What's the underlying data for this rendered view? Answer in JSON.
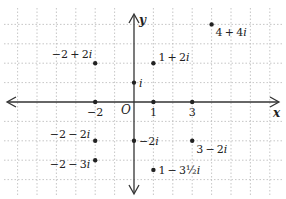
{
  "diagram": {
    "type": "complex-plane",
    "axes": {
      "x_label": "x",
      "y_label": "y",
      "origin_label": "O"
    },
    "grid": {
      "origin_px": [
        134,
        102
      ],
      "unit_px": 19.4,
      "x_range": [
        -6.5,
        7.5
      ],
      "y_range": [
        -4.9,
        5
      ]
    },
    "x_tick_labels": [
      {
        "value": -2,
        "text": "−2"
      },
      {
        "value": 1,
        "text": "1"
      },
      {
        "value": 3,
        "text": "3"
      }
    ],
    "points": [
      {
        "re": 4,
        "im": 4,
        "label": "4 + 4i",
        "anchor": "below-right"
      },
      {
        "re": -2,
        "im": 2,
        "label": "−2 + 2i",
        "anchor": "above-left"
      },
      {
        "re": 1,
        "im": 2,
        "label": "1 + 2i",
        "anchor": "right-up"
      },
      {
        "re": 0,
        "im": 1,
        "label": "i",
        "anchor": "right"
      },
      {
        "re": -2,
        "im": 0,
        "label": "",
        "anchor": "none"
      },
      {
        "re": 1,
        "im": 0,
        "label": "",
        "anchor": "none"
      },
      {
        "re": 3,
        "im": 0,
        "label": "",
        "anchor": "none"
      },
      {
        "re": -2,
        "im": -2,
        "label": "−2 − 2i",
        "anchor": "left"
      },
      {
        "re": 0,
        "im": -2,
        "label": "−2i",
        "anchor": "right"
      },
      {
        "re": 3,
        "im": -2,
        "label": "3 − 2i",
        "anchor": "below-right"
      },
      {
        "re": -2,
        "im": -3,
        "label": "−2 − 3i",
        "anchor": "below-left"
      },
      {
        "re": 1,
        "im": -3.5,
        "label": "1 − 3½i",
        "anchor": "right"
      }
    ],
    "colors": {
      "axis": "#333333",
      "grid": "#b8b8b8",
      "point": "#222222",
      "text": "#222222"
    }
  }
}
